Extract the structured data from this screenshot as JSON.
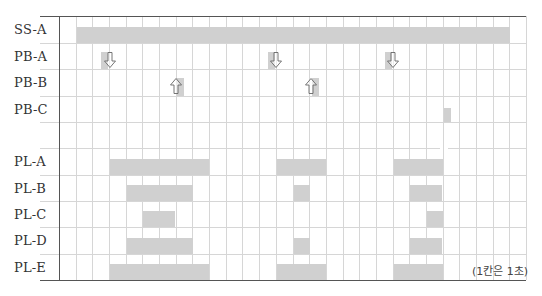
{
  "diagram": {
    "title": "",
    "caption": "(1칸은 1초)",
    "time_unit": "1 cell = 1 second",
    "columns": 28,
    "rows": [
      {
        "id": "SS-A",
        "label": "SS-A"
      },
      {
        "id": "PB-A",
        "label": "PB-A"
      },
      {
        "id": "PB-B",
        "label": "PB-B"
      },
      {
        "id": "PB-C",
        "label": "PB-C"
      },
      {
        "id": "blank",
        "label": ""
      },
      {
        "id": "PL-A",
        "label": "PL-A"
      },
      {
        "id": "PL-B",
        "label": "PL-B"
      },
      {
        "id": "PL-C",
        "label": "PL-C"
      },
      {
        "id": "PL-D",
        "label": "PL-D"
      },
      {
        "id": "PL-E",
        "label": "PL-E"
      }
    ],
    "bars": [
      {
        "row": "SS-A",
        "start_col": 1,
        "end_col": 26
      },
      {
        "row": "PB-C",
        "start_col": 23,
        "end_col": 23,
        "half": true
      },
      {
        "row": "PL-A",
        "start_col": 3,
        "end_col": 8
      },
      {
        "row": "PL-A",
        "start_col": 13,
        "end_col": 15
      },
      {
        "row": "PL-A",
        "start_col": 20,
        "end_col": 22
      },
      {
        "row": "PL-B",
        "start_col": 4,
        "end_col": 7
      },
      {
        "row": "PL-B",
        "start_col": 14,
        "end_col": 14
      },
      {
        "row": "PL-B",
        "start_col": 21,
        "end_col": 22
      },
      {
        "row": "PL-C",
        "start_col": 5,
        "end_col": 6
      },
      {
        "row": "PL-C",
        "start_col": 22,
        "end_col": 22
      },
      {
        "row": "PL-D",
        "start_col": 4,
        "end_col": 7
      },
      {
        "row": "PL-D",
        "start_col": 14,
        "end_col": 14
      },
      {
        "row": "PL-D",
        "start_col": 21,
        "end_col": 22
      },
      {
        "row": "PL-E",
        "start_col": 3,
        "end_col": 8
      },
      {
        "row": "PL-E",
        "start_col": 13,
        "end_col": 15
      },
      {
        "row": "PL-E",
        "start_col": 20,
        "end_col": 22
      }
    ],
    "arrows": [
      {
        "row": "PB-A",
        "direction": "down",
        "x": 110,
        "shade_x": 101
      },
      {
        "row": "PB-A",
        "direction": "down",
        "x": 276,
        "shade_x": 268
      },
      {
        "row": "PB-A",
        "direction": "down",
        "x": 393,
        "shade_x": 385
      },
      {
        "row": "PB-B",
        "direction": "up",
        "x": 176,
        "shade_x": 177
      },
      {
        "row": "PB-B",
        "direction": "up",
        "x": 311,
        "shade_x": 312
      }
    ],
    "colors": {
      "bar": "#d0d0d0",
      "grid": "#d6d6d6",
      "border": "#555555",
      "text": "#333333"
    }
  }
}
